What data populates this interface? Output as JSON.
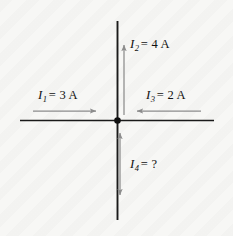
{
  "figure": {
    "background_color": "#f7f7f5",
    "wire_color": "#1a1a1a",
    "arrow_color": "#8c8c8c",
    "text_color": "#111111",
    "junction": {
      "x": 117,
      "y": 120,
      "radius": 3.2,
      "label": "junction-node"
    },
    "wires": [
      {
        "name": "horizontal-wire",
        "x1": 20,
        "y1": 120,
        "x2": 214,
        "y2": 120
      },
      {
        "name": "vertical-wire",
        "x1": 117,
        "y1": 21,
        "x2": 117,
        "y2": 220
      }
    ],
    "currents": [
      {
        "id": "I1",
        "symbol": "I",
        "subscript": "1",
        "equals": "=",
        "value": "3",
        "unit": "A",
        "text": "I1 = 3 A",
        "direction": "right",
        "arrow": {
          "x1": 33,
          "y1": 111,
          "x2": 99,
          "y2": 111,
          "heads": "end"
        }
      },
      {
        "id": "I2",
        "symbol": "I",
        "subscript": "2",
        "equals": "=",
        "value": "4",
        "unit": "A",
        "text": "I2 = 4 A",
        "direction": "up",
        "arrow": {
          "x1": 124,
          "y1": 115,
          "x2": 124,
          "y2": 42,
          "heads": "end"
        }
      },
      {
        "id": "I3",
        "symbol": "I",
        "subscript": "3",
        "equals": "=",
        "value": "2",
        "unit": "A",
        "text": "I3 = 2 A",
        "direction": "left",
        "arrow": {
          "x1": 201,
          "y1": 111,
          "x2": 134,
          "y2": 111,
          "heads": "end"
        }
      },
      {
        "id": "I4",
        "symbol": "I",
        "subscript": "4",
        "equals": "=",
        "value": "?",
        "unit": "",
        "text": "I4 = ?",
        "direction": "down",
        "arrow": {
          "x1": 120,
          "y1": 130,
          "x2": 120,
          "y2": 198,
          "heads": "both"
        }
      }
    ]
  }
}
